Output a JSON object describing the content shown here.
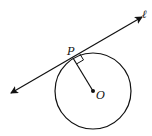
{
  "diagram": {
    "type": "geometry",
    "labels": {
      "tangent_point": "P",
      "center": "O",
      "line": "ℓ"
    },
    "circle": {
      "cx": 93,
      "cy": 91,
      "r": 38
    },
    "points": {
      "P": {
        "x": 73,
        "y": 58
      },
      "O": {
        "x": 93,
        "y": 91
      }
    },
    "line": {
      "x1": 11,
      "y1": 93,
      "x2": 142,
      "y2": 17
    },
    "right_angle_marker": true,
    "colors": {
      "stroke": "#111111",
      "background": "#ffffff"
    }
  }
}
